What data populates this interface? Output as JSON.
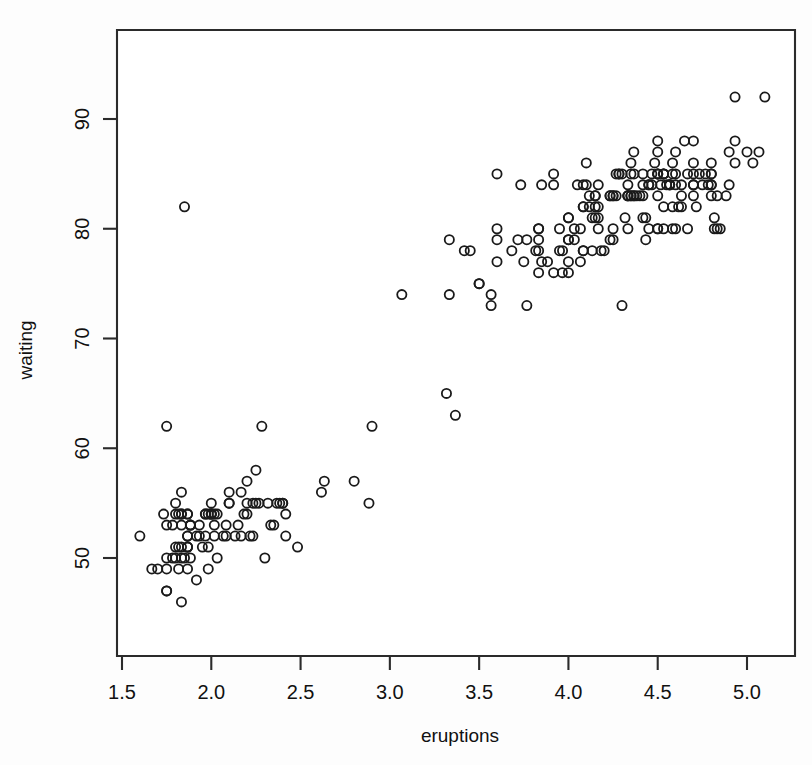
{
  "chart_data": {
    "type": "scatter",
    "title": "",
    "xlabel": "eruptions",
    "ylabel": "waiting",
    "xlim": [
      1.52,
      5.32
    ],
    "ylim": [
      41.5,
      98.5
    ],
    "xticks": [
      "1.5",
      "2.0",
      "2.5",
      "3.0",
      "3.5",
      "4.0",
      "4.5",
      "5.0"
    ],
    "xtick_values": [
      1.5,
      2.0,
      2.5,
      3.0,
      3.5,
      4.0,
      4.5,
      5.0
    ],
    "yticks": [
      "50",
      "60",
      "70",
      "80",
      "90"
    ],
    "ytick_values": [
      50,
      60,
      70,
      80,
      90
    ],
    "grid": false,
    "legend": "none",
    "marker": "open-circle",
    "marker_color": "#1a1a1a",
    "marker_radius_px": 4.6,
    "background_color": "#ffffff",
    "n_points": 272,
    "series": [
      {
        "name": "faithful",
        "x": [
          3.6,
          1.8,
          3.333,
          2.283,
          4.533,
          2.883,
          4.7,
          3.6,
          1.95,
          4.35,
          1.833,
          3.917,
          4.2,
          1.75,
          4.7,
          2.167,
          1.75,
          4.8,
          1.6,
          4.25,
          1.8,
          1.75,
          3.45,
          3.067,
          4.533,
          3.6,
          1.967,
          4.083,
          3.85,
          4.433,
          4.3,
          4.467,
          3.367,
          4.033,
          3.833,
          2.017,
          1.867,
          4.833,
          1.833,
          4.783,
          4.35,
          1.883,
          4.567,
          1.75,
          4.533,
          3.317,
          3.833,
          2.1,
          4.633,
          2.0,
          4.8,
          4.716,
          1.833,
          4.833,
          1.733,
          4.883,
          3.717,
          1.667,
          4.567,
          4.317,
          2.233,
          4.5,
          1.75,
          4.8,
          1.817,
          4.4,
          4.167,
          4.7,
          2.067,
          4.7,
          4.033,
          1.967,
          4.5,
          4.0,
          1.983,
          5.067,
          2.017,
          4.567,
          3.883,
          3.6,
          4.133,
          4.333,
          4.1,
          2.633,
          4.067,
          4.933,
          3.95,
          4.517,
          2.167,
          4.0,
          2.2,
          4.333,
          1.867,
          4.817,
          1.833,
          4.3,
          4.667,
          3.75,
          1.867,
          4.9,
          2.483,
          4.367,
          2.1,
          4.5,
          4.05,
          1.867,
          4.7,
          1.783,
          4.85,
          3.683,
          4.733,
          2.3,
          4.9,
          4.417,
          1.7,
          4.633,
          2.317,
          4.6,
          1.817,
          4.417,
          2.617,
          4.067,
          4.25,
          1.967,
          4.6,
          3.767,
          1.917,
          4.5,
          2.267,
          4.65,
          1.867,
          4.167,
          2.8,
          4.333,
          1.833,
          4.383,
          1.883,
          4.933,
          2.033,
          3.733,
          4.233,
          2.233,
          4.533,
          4.817,
          4.333,
          1.983,
          4.633,
          2.017,
          5.1,
          1.8,
          5.033,
          4.0,
          2.4,
          4.6,
          3.567,
          4.0,
          4.5,
          4.083,
          1.8,
          3.967,
          2.2,
          4.15,
          2.0,
          3.833,
          3.5,
          4.583,
          2.367,
          5.0,
          1.933,
          4.617,
          1.917,
          2.083,
          4.583,
          3.333,
          4.167,
          4.333,
          4.5,
          2.417,
          4.0,
          4.167,
          1.883,
          4.583,
          4.25,
          3.767,
          2.033,
          4.433,
          4.083,
          1.833,
          4.417,
          2.183,
          4.8,
          1.833,
          4.8,
          4.1,
          3.966,
          4.233,
          3.5,
          4.366,
          2.25,
          4.667,
          2.1,
          4.35,
          4.133,
          1.867,
          4.6,
          1.783,
          4.367,
          3.85,
          1.933,
          4.5,
          2.383,
          4.7,
          1.867,
          3.833,
          3.417,
          4.233,
          2.4,
          4.8,
          2.0,
          4.15,
          1.867,
          4.267,
          1.75,
          4.483,
          4.0,
          4.117,
          4.083,
          4.267,
          3.917,
          4.55,
          4.083,
          2.417,
          4.183,
          2.217,
          4.45,
          1.883,
          1.85,
          4.283,
          3.95,
          2.333,
          4.15,
          2.35,
          4.933,
          2.9,
          4.583,
          3.833,
          2.083,
          4.367,
          2.133,
          4.35,
          2.2,
          4.45,
          3.567,
          4.5,
          4.15,
          3.817,
          3.917,
          4.45,
          2.0,
          4.283,
          4.767,
          4.533,
          1.85,
          4.25,
          1.983,
          2.25,
          4.75,
          4.117,
          2.15,
          4.417,
          1.817,
          4.467
        ],
        "y": [
          79,
          54,
          74,
          62,
          85,
          55,
          88,
          85,
          51,
          85,
          54,
          84,
          78,
          47,
          83,
          52,
          62,
          84,
          52,
          79,
          51,
          47,
          78,
          74,
          85,
          77,
          54,
          84,
          84,
          79,
          73,
          85,
          63,
          79,
          80,
          54,
          54,
          80,
          53,
          84,
          83,
          53,
          84,
          53,
          80,
          65,
          78,
          55,
          82,
          54,
          83,
          82,
          46,
          83,
          54,
          83,
          79,
          49,
          84,
          81,
          55,
          87,
          49,
          86,
          54,
          83,
          81,
          84,
          52,
          84,
          80,
          52,
          88,
          77,
          54,
          87,
          53,
          84,
          77,
          80,
          81,
          83,
          86,
          57,
          77,
          92,
          80,
          84,
          56,
          81,
          57,
          83,
          52,
          80,
          56,
          85,
          85,
          77,
          54,
          84,
          51,
          83,
          55,
          85,
          84,
          51,
          85,
          50,
          80,
          78,
          85,
          50,
          87,
          85,
          49,
          84,
          55,
          87,
          51,
          84,
          56,
          80,
          83,
          54,
          85,
          79,
          48,
          85,
          55,
          88,
          51,
          84,
          57,
          84,
          50,
          83,
          50,
          88,
          50,
          84,
          83,
          52,
          85,
          81,
          80,
          49,
          83,
          52,
          92,
          50,
          86,
          76,
          55,
          80,
          74,
          79,
          83,
          82,
          55,
          78,
          54,
          83,
          54,
          76,
          75,
          82,
          55,
          87,
          53,
          82,
          52,
          52,
          80,
          79,
          82,
          83,
          80,
          54,
          81,
          80,
          53,
          86,
          80,
          73,
          54,
          81,
          78,
          51,
          81,
          54,
          84,
          54,
          85,
          84,
          76,
          79,
          75,
          87,
          55,
          80,
          56,
          83,
          78,
          51,
          84,
          53,
          85,
          77,
          52,
          80,
          55,
          86,
          52,
          79,
          78,
          83,
          55,
          85,
          54,
          83,
          49,
          83,
          50,
          86,
          79,
          83,
          78,
          85,
          76,
          84,
          82,
          52,
          78,
          52,
          84,
          53,
          82,
          85,
          78,
          53,
          82,
          53,
          86,
          62,
          85,
          80,
          53,
          83,
          52,
          86,
          55,
          84,
          73,
          85,
          81,
          78,
          85,
          80,
          55,
          85,
          85,
          82,
          50,
          83,
          51,
          58,
          84,
          82,
          53,
          83,
          49,
          84
        ]
      }
    ]
  },
  "axes": {
    "xlabel": "eruptions",
    "ylabel": "waiting"
  }
}
